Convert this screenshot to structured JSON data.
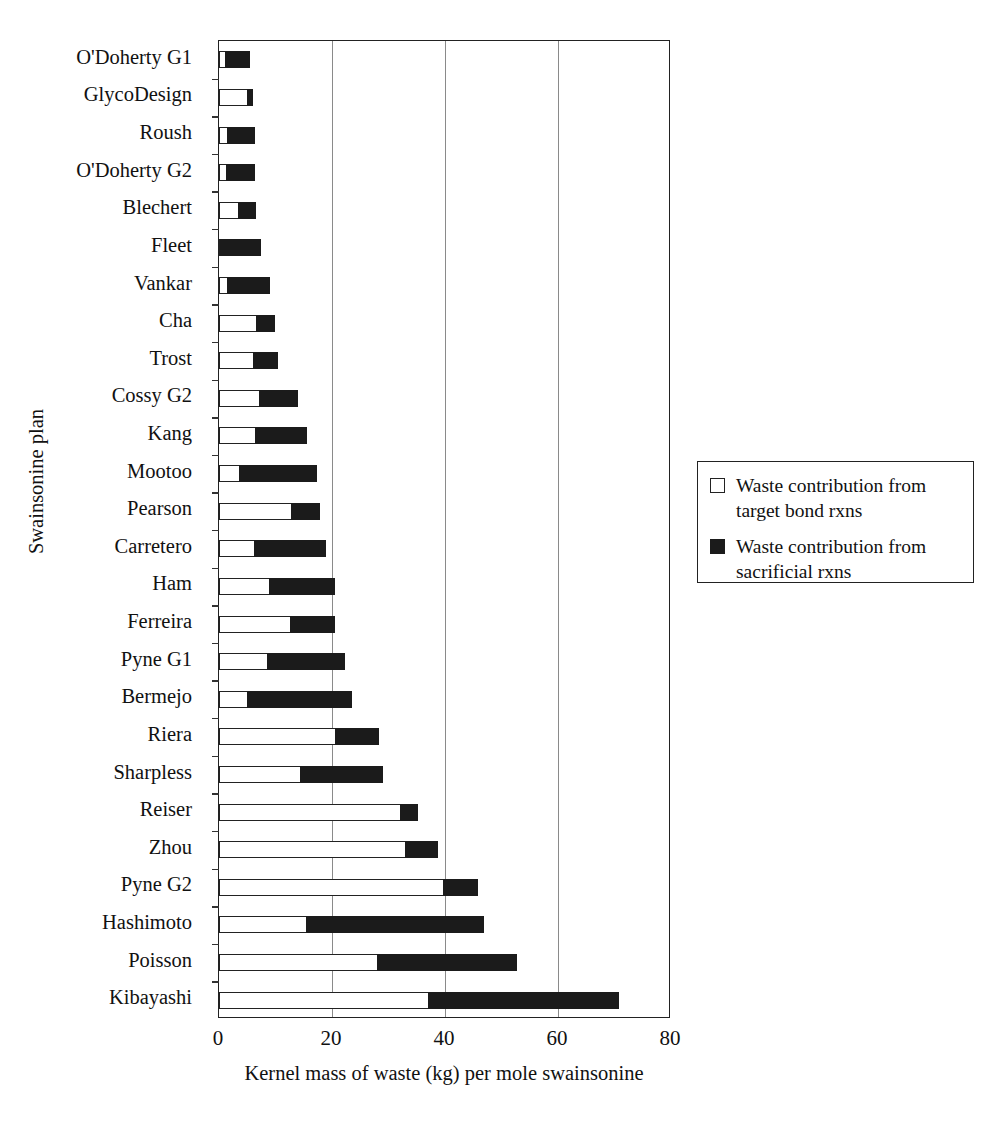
{
  "chart_data": {
    "type": "bar",
    "orientation": "horizontal",
    "stacked": true,
    "title": "",
    "xlabel": "Kernel mass of waste (kg) per mole swainsonine",
    "ylabel": "Swainsonine plan",
    "xlim": [
      0,
      80
    ],
    "xticks": [
      0,
      20,
      40,
      60,
      80
    ],
    "xtick_labels": [
      "0",
      "20",
      "40",
      "60",
      "80"
    ],
    "grid": "vertical",
    "legend_position": "right",
    "categories": [
      "O'Doherty G1",
      "GlycoDesign",
      "Roush",
      "O'Doherty G2",
      "Blechert",
      "Fleet",
      "Vankar",
      "Cha",
      "Trost",
      "Cossy G2",
      "Kang",
      "Mootoo",
      "Pearson",
      "Carretero",
      "Ham",
      "Ferreira",
      "Pyne G1",
      "Bermejo",
      "Riera",
      "Sharpless",
      "Reiser",
      "Zhou",
      "Pyne G2",
      "Hashimoto",
      "Poisson",
      "Kibayashi"
    ],
    "series": [
      {
        "name": "Waste contribution from target bond rxns",
        "color": "#ffffff",
        "values": [
          1.2,
          5.2,
          1.7,
          1.4,
          3.6,
          0.4,
          1.6,
          6.8,
          6.3,
          7.3,
          6.6,
          3.8,
          13.0,
          6.4,
          9.0,
          12.8,
          8.7,
          5.2,
          20.7,
          14.6,
          32.3,
          33.2,
          39.9,
          15.6,
          28.1,
          37.2
        ]
      },
      {
        "name": "Waste contribution from sacrificial rxns",
        "color": "#1b1b1b",
        "values": [
          4.5,
          1.1,
          4.9,
          5.2,
          3.2,
          7.2,
          7.6,
          3.3,
          4.3,
          6.9,
          9.2,
          13.7,
          5.1,
          12.7,
          11.7,
          7.9,
          13.9,
          18.6,
          7.9,
          14.6,
          3.1,
          5.7,
          6.1,
          31.6,
          24.9,
          33.8
        ]
      }
    ],
    "totals": [
      5.7,
      6.3,
      6.6,
      6.6,
      6.8,
      7.6,
      9.2,
      10.1,
      10.6,
      14.2,
      15.8,
      17.5,
      18.1,
      19.1,
      20.7,
      20.7,
      22.6,
      23.8,
      28.6,
      29.2,
      35.4,
      38.9,
      46.0,
      47.2,
      53.0,
      71.0
    ]
  },
  "legend": {
    "entries": [
      {
        "swatch": "white-square-icon",
        "label_line1": "Waste contribution from",
        "label_line2": "target bond rxns"
      },
      {
        "swatch": "black-square-icon",
        "label_line1": "Waste contribution from",
        "label_line2": "sacrificial rxns"
      }
    ]
  }
}
